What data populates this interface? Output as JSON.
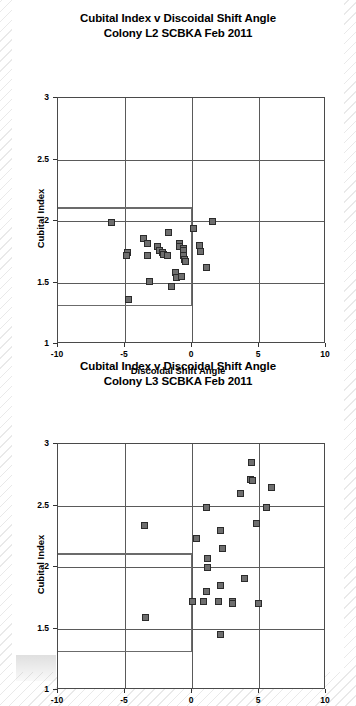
{
  "page": {
    "background_style": "diagonal-hatch",
    "card_color": "#ffffff"
  },
  "charts": [
    {
      "id": "chart-l2",
      "title_line1": "Cubital Index v Discoidal Shift Angle",
      "title_line2": "Colony L2 SCBKA Feb 2011"
    },
    {
      "id": "chart-l3",
      "title_line1": "Cubital Index v Discoidal Shift Angle",
      "title_line2": "Colony L3 SCBKA Feb 2011"
    }
  ],
  "chart_data": [
    {
      "type": "scatter",
      "id": "chart-l2",
      "title": "Cubital Index v Discoidal Shift Angle Colony L2 SCBKA Feb 2011",
      "xlabel": "Discoidal Shift Angle",
      "ylabel": "Cubital Index",
      "xlim": [
        -10,
        10
      ],
      "ylim": [
        1,
        3
      ],
      "xticks": [
        -10,
        -5,
        0,
        5,
        10
      ],
      "xticklabels": [
        "-10",
        "-5",
        "0",
        "5",
        "10"
      ],
      "yticks": [
        1,
        1.5,
        2,
        2.5,
        3
      ],
      "yticklabels": [
        "1",
        "1.5",
        "2",
        "2.5",
        "3"
      ],
      "grid": true,
      "legend": null,
      "marker_color": "#6e6e6e",
      "marker_edge_color": "#2b2b2b",
      "reference_box": {
        "x0": -10,
        "x1": 0,
        "y0": 1.32,
        "y1": 2.11,
        "description": "breed standard rectangle"
      },
      "points": [
        {
          "x": -6.0,
          "y": 1.99
        },
        {
          "x": -4.85,
          "y": 1.74
        },
        {
          "x": -4.9,
          "y": 1.72
        },
        {
          "x": -4.75,
          "y": 1.36
        },
        {
          "x": -3.6,
          "y": 1.86
        },
        {
          "x": -3.3,
          "y": 1.82
        },
        {
          "x": -3.3,
          "y": 1.72
        },
        {
          "x": -3.2,
          "y": 1.51
        },
        {
          "x": -2.6,
          "y": 1.79
        },
        {
          "x": -2.4,
          "y": 1.76
        },
        {
          "x": -2.2,
          "y": 1.74
        },
        {
          "x": -2.15,
          "y": 1.73
        },
        {
          "x": -1.75,
          "y": 1.91
        },
        {
          "x": -1.8,
          "y": 1.72
        },
        {
          "x": -1.55,
          "y": 1.47
        },
        {
          "x": -1.2,
          "y": 1.58
        },
        {
          "x": -1.15,
          "y": 1.54
        },
        {
          "x": -0.95,
          "y": 1.82
        },
        {
          "x": -0.9,
          "y": 1.79
        },
        {
          "x": -0.65,
          "y": 1.78
        },
        {
          "x": -0.6,
          "y": 1.76
        },
        {
          "x": -0.6,
          "y": 1.72
        },
        {
          "x": -0.55,
          "y": 1.69
        },
        {
          "x": -0.5,
          "y": 1.67
        },
        {
          "x": -0.8,
          "y": 1.55
        },
        {
          "x": 0.1,
          "y": 1.94
        },
        {
          "x": 0.55,
          "y": 1.8
        },
        {
          "x": 0.6,
          "y": 1.75
        },
        {
          "x": 1.1,
          "y": 1.62
        },
        {
          "x": 1.55,
          "y": 2.0
        }
      ]
    },
    {
      "type": "scatter",
      "id": "chart-l3",
      "title": "Cubital Index v Discoidal Shift Angle Colony L3 SCBKA Feb 2011",
      "xlabel": "Discoidal Shift Angle",
      "ylabel": "Cubital Index",
      "xlim": [
        -10,
        10
      ],
      "ylim": [
        1,
        3
      ],
      "xticks": [
        -10,
        -5,
        0,
        5,
        10
      ],
      "xticklabels": [
        "-10",
        "-5",
        "0",
        "5",
        "10"
      ],
      "yticks": [
        1,
        1.5,
        2,
        2.5,
        3
      ],
      "yticklabels": [
        "1",
        "1.5",
        "2",
        "2.5",
        "3"
      ],
      "grid": true,
      "legend": null,
      "marker_color": "#6e6e6e",
      "marker_edge_color": "#2b2b2b",
      "reference_box": {
        "x0": -10,
        "x1": 0,
        "y0": 1.32,
        "y1": 2.11,
        "description": "breed standard rectangle"
      },
      "points": [
        {
          "x": -3.55,
          "y": 2.34
        },
        {
          "x": -3.5,
          "y": 1.59
        },
        {
          "x": 0.0,
          "y": 1.72
        },
        {
          "x": 0.35,
          "y": 2.23
        },
        {
          "x": 1.1,
          "y": 2.48
        },
        {
          "x": 1.15,
          "y": 2.07
        },
        {
          "x": 1.15,
          "y": 2.0
        },
        {
          "x": 1.1,
          "y": 1.8
        },
        {
          "x": 0.85,
          "y": 1.72
        },
        {
          "x": 2.15,
          "y": 2.3
        },
        {
          "x": 2.25,
          "y": 2.15
        },
        {
          "x": 2.1,
          "y": 1.85
        },
        {
          "x": 1.95,
          "y": 1.72
        },
        {
          "x": 2.1,
          "y": 1.45
        },
        {
          "x": 3.0,
          "y": 1.72
        },
        {
          "x": 3.05,
          "y": 1.7
        },
        {
          "x": 3.6,
          "y": 2.6
        },
        {
          "x": 3.95,
          "y": 1.91
        },
        {
          "x": 4.45,
          "y": 2.85
        },
        {
          "x": 4.4,
          "y": 2.71
        },
        {
          "x": 4.55,
          "y": 2.7
        },
        {
          "x": 4.8,
          "y": 2.35
        },
        {
          "x": 4.95,
          "y": 1.7
        },
        {
          "x": 5.55,
          "y": 2.48
        },
        {
          "x": 5.95,
          "y": 2.65
        }
      ]
    }
  ]
}
